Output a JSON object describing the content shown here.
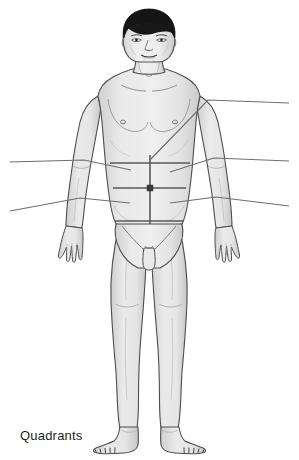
{
  "figure": {
    "caption": "Quadrants",
    "view": "anterior",
    "background_color": "#ffffff",
    "body_fill_color": "#e8e8e8",
    "body_shade_color": "#d2d2d2",
    "outline_color": "#4d4d4d",
    "hair_color": "#1a1a1a",
    "quadrant_line_color": "#595959",
    "leader_line_color": "#6e6e6e",
    "caption_color": "#231f20"
  },
  "diagram": {
    "title": "Quadrants",
    "type": "anatomical-region-diagram",
    "region_divisions": {
      "name": "abdominopelvic quadrants",
      "count": 4,
      "divider_lines": [
        {
          "id": "median-vertical-line",
          "orientation": "vertical",
          "description": "midsagittal line through umbilicus"
        },
        {
          "id": "transumbilical-horizontal-line",
          "orientation": "horizontal",
          "description": "transumbilical line through umbilicus"
        }
      ],
      "intersection_marker": {
        "id": "umbilicus-marker",
        "label": "umbilicus",
        "shape": "square"
      },
      "quadrants": [
        {
          "id": "right-upper-quadrant",
          "label": "",
          "position": "upper-left-of-image"
        },
        {
          "id": "left-upper-quadrant",
          "label": "",
          "position": "upper-right-of-image"
        },
        {
          "id": "right-lower-quadrant",
          "label": "",
          "position": "lower-left-of-image"
        },
        {
          "id": "left-lower-quadrant",
          "label": "",
          "position": "lower-right-of-image"
        }
      ]
    },
    "leader_lines": [
      {
        "id": "leader-upper-right-chest",
        "label": "",
        "side": "right",
        "points_to": "upper chest / shoulder"
      },
      {
        "id": "leader-middle-left",
        "label": "",
        "side": "left",
        "points_to": "right upper quadrant"
      },
      {
        "id": "leader-middle-right",
        "label": "",
        "side": "right",
        "points_to": "left upper quadrant"
      },
      {
        "id": "leader-lower-left",
        "label": "",
        "side": "left",
        "points_to": "right lower quadrant"
      },
      {
        "id": "leader-lower-right",
        "label": "",
        "side": "right",
        "points_to": "left lower quadrant"
      }
    ],
    "body_parts": [
      {
        "id": "head",
        "label": ""
      },
      {
        "id": "hair",
        "label": ""
      },
      {
        "id": "face",
        "label": ""
      },
      {
        "id": "neck",
        "label": ""
      },
      {
        "id": "torso",
        "label": ""
      },
      {
        "id": "left-arm",
        "label": ""
      },
      {
        "id": "right-arm",
        "label": ""
      },
      {
        "id": "left-hand",
        "label": ""
      },
      {
        "id": "right-hand",
        "label": ""
      },
      {
        "id": "pelvis",
        "label": ""
      },
      {
        "id": "left-leg",
        "label": ""
      },
      {
        "id": "right-leg",
        "label": ""
      },
      {
        "id": "left-foot",
        "label": ""
      },
      {
        "id": "right-foot",
        "label": ""
      }
    ]
  }
}
